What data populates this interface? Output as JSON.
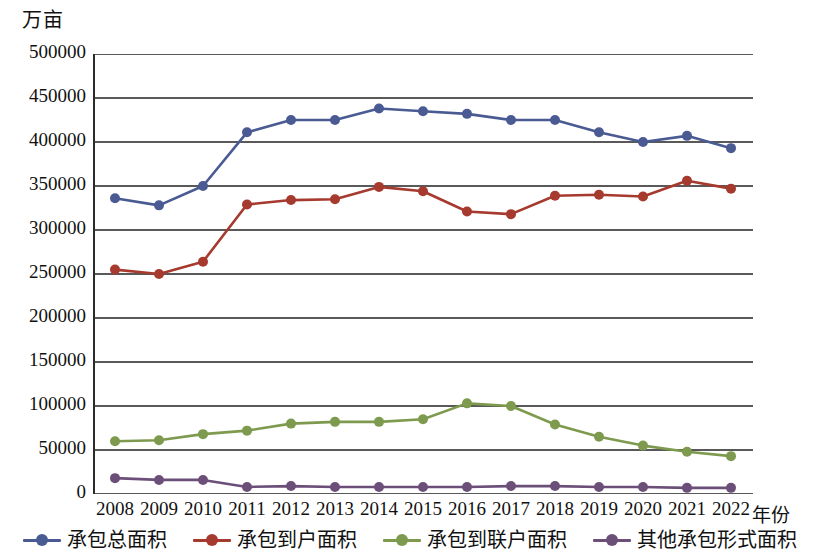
{
  "chart_data": {
    "type": "line",
    "title": "",
    "unit_label": "万亩",
    "xlabel": "年份",
    "ylabel": "",
    "ylim": [
      0,
      500000
    ],
    "ytick_step": 50000,
    "grid": "horizontal",
    "legend_position": "bottom",
    "yticks": [
      "500000",
      "450000",
      "400000",
      "350000",
      "300000",
      "250000",
      "200000",
      "150000",
      "100000",
      "50000",
      "0"
    ],
    "categories": [
      "2008",
      "2009",
      "2010",
      "2011",
      "2012",
      "2013",
      "2014",
      "2015",
      "2016",
      "2017",
      "2018",
      "2019",
      "2020",
      "2021",
      "2022"
    ],
    "series": [
      {
        "name": "承包总面积",
        "color": "#4a5a93",
        "values": [
          336000,
          328000,
          350000,
          411000,
          425000,
          425000,
          438000,
          435000,
          432000,
          425000,
          425000,
          411000,
          400000,
          407000,
          393000
        ]
      },
      {
        "name": "承包到户面积",
        "color": "#a63a2e",
        "values": [
          255000,
          250000,
          264000,
          329000,
          334000,
          335000,
          349000,
          344000,
          321000,
          318000,
          339000,
          340000,
          338000,
          356000,
          347000
        ]
      },
      {
        "name": "承包到联户面积",
        "color": "#7d9a4e",
        "values": [
          60000,
          61000,
          68000,
          72000,
          80000,
          82000,
          82000,
          85000,
          103000,
          100000,
          79000,
          65000,
          55000,
          48000,
          43000
        ]
      },
      {
        "name": "其他承包形式面积",
        "color": "#6b4f79",
        "values": [
          18000,
          16000,
          16000,
          8000,
          9000,
          8000,
          8000,
          8000,
          8000,
          9000,
          9000,
          8000,
          8000,
          7000,
          7000
        ]
      }
    ]
  }
}
